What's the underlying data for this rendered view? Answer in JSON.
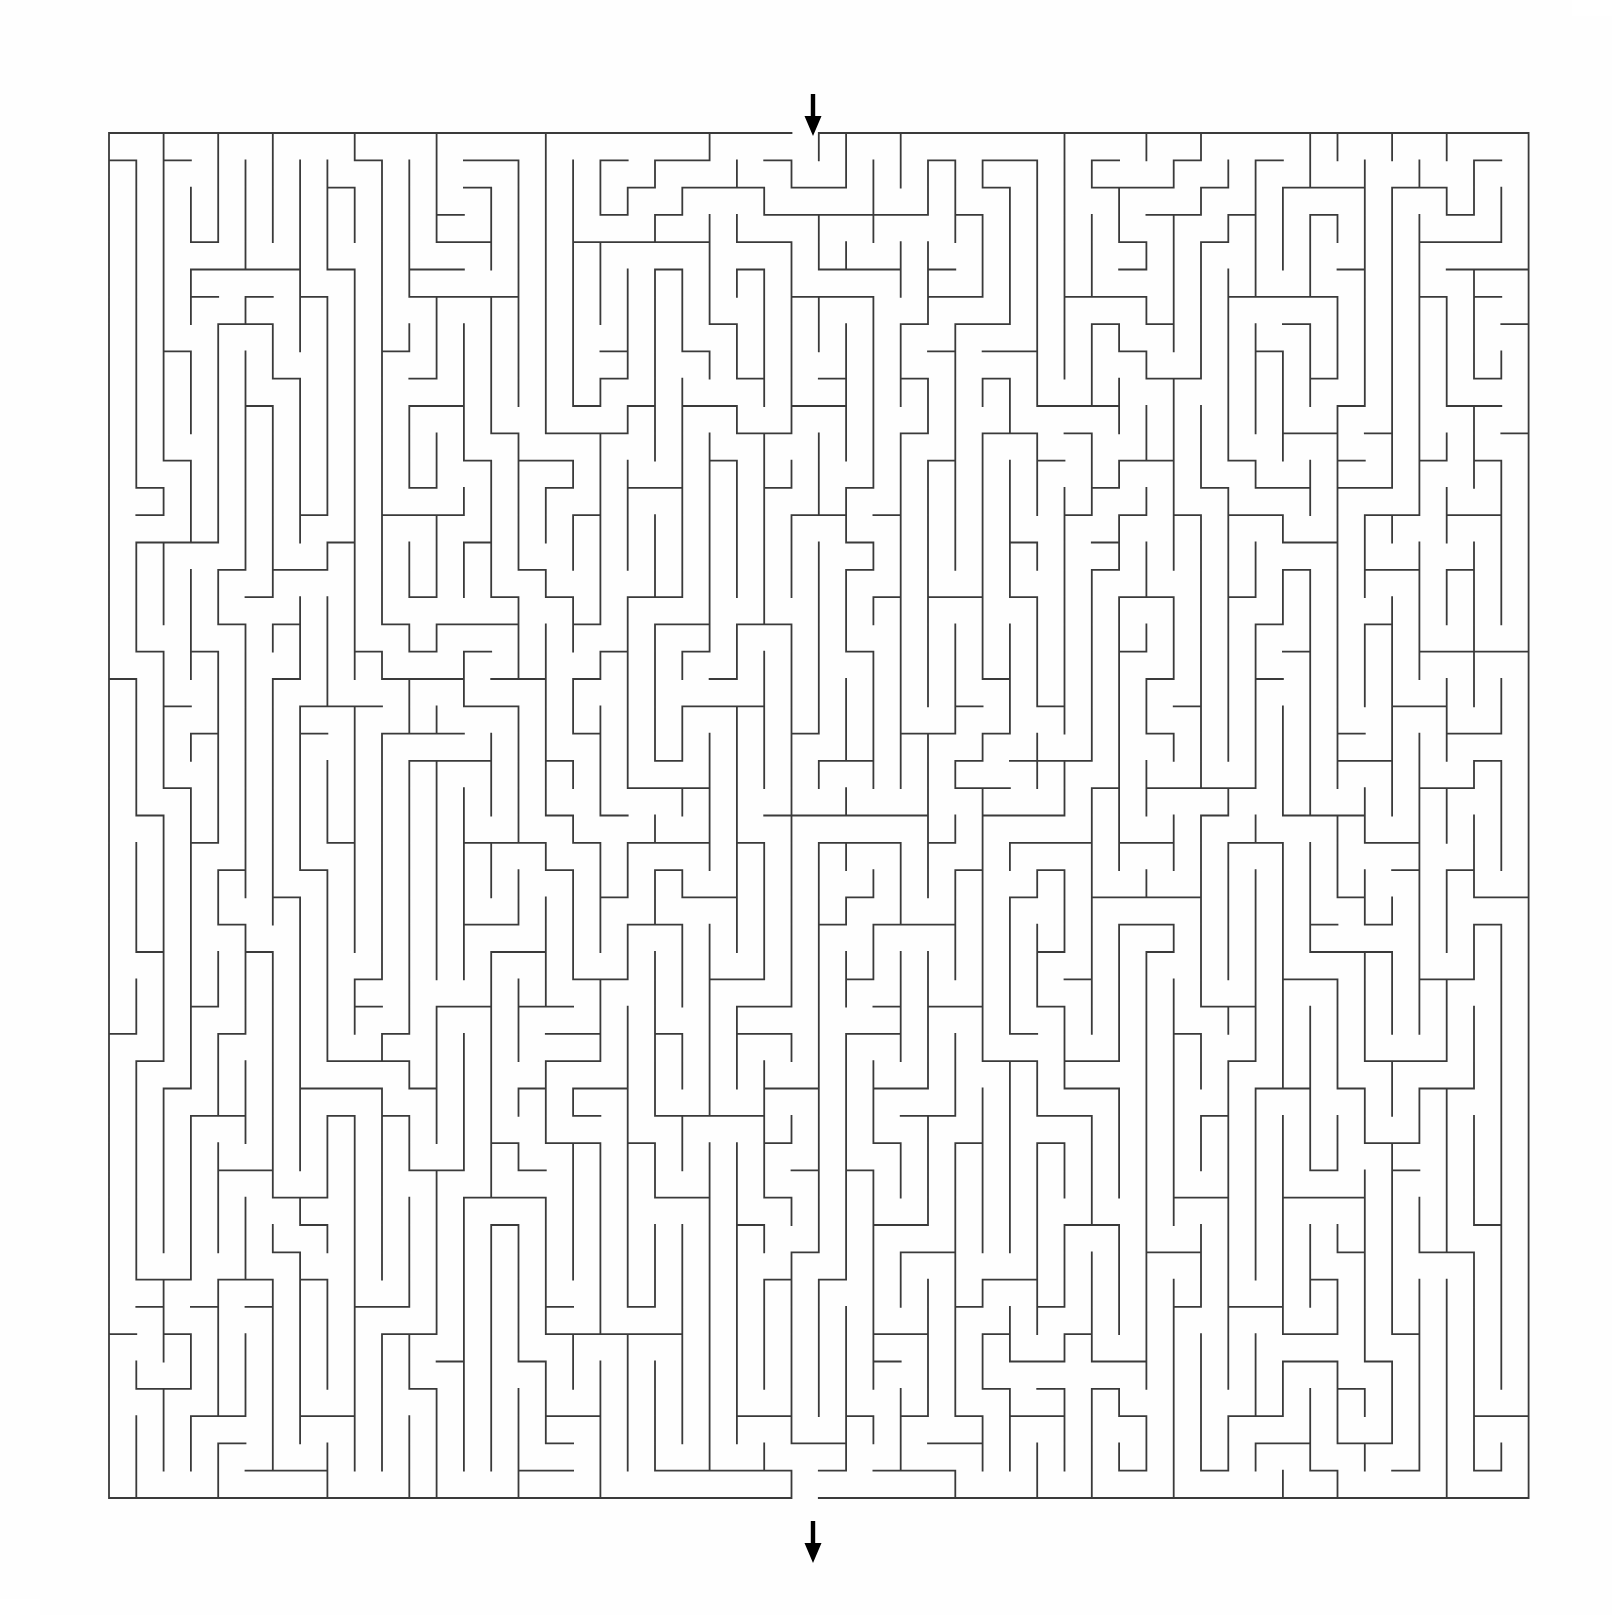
{
  "document": {
    "title": "Maze Puzzle",
    "background_color": "#fefefe"
  },
  "maze": {
    "name": "rectangular-perfect-maze",
    "wall_color": "#3a3a3a",
    "wall_thickness_px": 1.8,
    "background_color": "#fefefe",
    "columns": 52,
    "rows": 50,
    "cell_size_px": 27.3,
    "origin_x_px": 69,
    "origin_y_px": 117,
    "width_px": 1420,
    "height_px": 1375,
    "bias": "vertical",
    "entrance": {
      "name": "entrance",
      "side": "top",
      "column": 25,
      "arrow_direction": "down",
      "arrow_color": "#000000",
      "arrow_x_px": 773,
      "arrow_y_px": 78
    },
    "exit": {
      "name": "exit",
      "side": "bottom",
      "column": 25,
      "arrow_direction": "down",
      "arrow_color": "#000000",
      "arrow_x_px": 773,
      "arrow_y_px": 1505
    },
    "seed": 20240517
  },
  "chart_data": {
    "type": "table",
    "title": "",
    "columns": 52,
    "rows": 50,
    "cell_size": 27.3,
    "entrance_column": 25,
    "exit_column": 25,
    "vertical_bias": 0.78,
    "wall_color": "#3a3a3a"
  }
}
